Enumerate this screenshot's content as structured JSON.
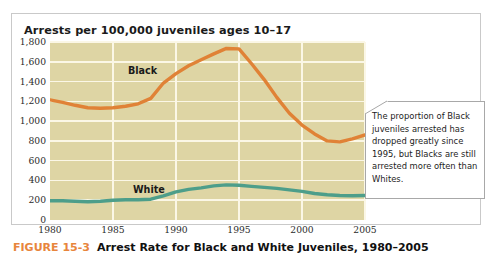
{
  "figure": {
    "chart_title": "Arrests per 100,000 juveniles ages 10–17",
    "caption_number": "FIGURE 15-3",
    "caption_text": "Arrest Rate for Black and White Juveniles, 1980–2005"
  },
  "callout": {
    "text": "The proportion of Black juveniles arrested has dropped greatly since 1995, but Blacks are still arrested more often than Whites."
  },
  "colors": {
    "black_series": "#e08236",
    "white_series": "#4d9e8a",
    "plot_background": "#ded5a4",
    "gridline": "#fbf7e6",
    "figure_number": "#e8853c"
  },
  "chart_data": {
    "type": "line",
    "title": "Arrests per 100,000 juveniles ages 10–17",
    "xlabel": "",
    "ylabel": "Arrests per 100,000 juveniles ages 10–17",
    "xlim": [
      1980,
      2005
    ],
    "ylim": [
      0,
      1800
    ],
    "grid": true,
    "legend": "inline-labels",
    "ytick_labels": [
      "1,800",
      "1,600",
      "1,400",
      "1,200",
      "1,000",
      "800",
      "600",
      "400",
      "200",
      "0"
    ],
    "ytick_values": [
      1800,
      1600,
      1400,
      1200,
      1000,
      800,
      600,
      400,
      200,
      0
    ],
    "xtick_labels": [
      "1980",
      "1985",
      "1990",
      "1995",
      "2000",
      "2005"
    ],
    "xtick_values": [
      1980,
      1985,
      1990,
      1995,
      2000,
      2005
    ],
    "x": [
      1980,
      1981,
      1982,
      1983,
      1984,
      1985,
      1986,
      1987,
      1988,
      1989,
      1990,
      1991,
      1992,
      1993,
      1994,
      1995,
      1996,
      1997,
      1998,
      1999,
      2000,
      2001,
      2002,
      2003,
      2004,
      2005
    ],
    "series": [
      {
        "name": "Black",
        "color": "#e08236",
        "values": [
          1215,
          1190,
          1160,
          1135,
          1130,
          1135,
          1150,
          1175,
          1230,
          1385,
          1480,
          1560,
          1620,
          1680,
          1735,
          1730,
          1580,
          1420,
          1240,
          1080,
          960,
          870,
          800,
          790,
          820,
          860
        ]
      },
      {
        "name": "White",
        "color": "#4d9e8a",
        "values": [
          195,
          195,
          190,
          185,
          190,
          200,
          205,
          205,
          210,
          245,
          285,
          310,
          325,
          345,
          355,
          352,
          340,
          330,
          320,
          305,
          290,
          268,
          255,
          248,
          245,
          248
        ]
      }
    ]
  }
}
